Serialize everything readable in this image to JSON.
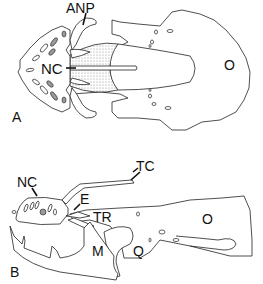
{
  "figure": {
    "panels": [
      {
        "id": "A",
        "view": "dorsal",
        "panel_label": "A",
        "labels": {
          "anp": "ANP",
          "nc": "NC",
          "o": "O"
        }
      },
      {
        "id": "B",
        "view": "lateral",
        "panel_label": "B",
        "labels": {
          "nc": "NC",
          "tc": "TC",
          "e": "E",
          "tr": "TR",
          "o": "O",
          "m": "M",
          "q": "Q"
        }
      }
    ],
    "colors": {
      "line": "#222222",
      "background": "#ffffff",
      "stipple": "#999999"
    }
  }
}
